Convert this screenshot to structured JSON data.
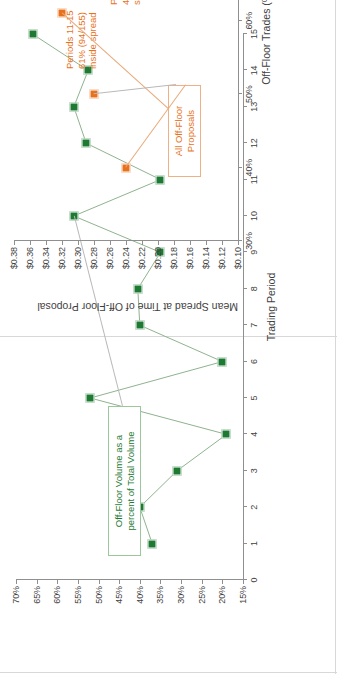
{
  "document": {
    "title": "Off-Floor Trading Charts",
    "orientation": "rotated-90-ccw",
    "background": "#ffffff"
  },
  "colors": {
    "green": "#1E7A32",
    "orange": "#E8721C",
    "navy": "#23337E",
    "axis": "#8F8F8F",
    "text": "#3F3F3F",
    "leader": "#B9B9B9"
  },
  "chart_data": [
    {
      "id": "off-floor-volume-by-period",
      "type": "line",
      "title": "",
      "xlabel": "Trading Period",
      "ylabel": "",
      "grid": false,
      "legend": "none",
      "legend_position": "none",
      "series_color": "#1E7A32",
      "xlim": [
        0,
        15
      ],
      "ylim": [
        15,
        70
      ],
      "xticks": [
        "0",
        "1",
        "2",
        "3",
        "4",
        "5",
        "6",
        "7",
        "8",
        "9",
        "10",
        "11",
        "12",
        "13",
        "14",
        "15"
      ],
      "yticks": [
        "70%",
        "65%",
        "60%",
        "55%",
        "50%",
        "45%",
        "40%",
        "35%",
        "30%",
        "25%",
        "20%",
        "15%"
      ],
      "ytick_values": [
        70,
        65,
        60,
        55,
        50,
        45,
        40,
        35,
        30,
        25,
        20,
        15
      ],
      "x": [
        1,
        2,
        3,
        4,
        5,
        6,
        7,
        8,
        9,
        10,
        11,
        12,
        13,
        14,
        15
      ],
      "values": [
        37,
        40,
        31,
        19,
        52,
        20,
        40,
        40.5,
        35,
        56,
        35,
        53,
        56,
        52.5,
        66
      ],
      "annotations": [
        {
          "text": "Off-Floor Volume as a\npercent of Total Volume",
          "color": "#1E7A32",
          "anchor_x": 10,
          "anchor_y": 56
        }
      ]
    },
    {
      "id": "mean-spread-vs-off-floor-trades",
      "type": "scatter",
      "title": "",
      "xlabel": "Off-Floor Trades (% of total trading volume)",
      "ylabel": "Mean Spread at Time of Off-Floor Proposal",
      "grid": false,
      "legend": "none",
      "legend_position": "none",
      "xlim": [
        30,
        100
      ],
      "ylim": [
        0.1,
        0.38
      ],
      "xticks": [
        "30%",
        "40%",
        "50%",
        "60%",
        "70%",
        "80%",
        "90%",
        "100%"
      ],
      "xtick_values": [
        30,
        40,
        50,
        60,
        70,
        80,
        90,
        100
      ],
      "yticks": [
        "$0.38",
        "$0.36",
        "$0.34",
        "$0.32",
        "$0.30",
        "$0.28",
        "$0.26",
        "$0.24",
        "$0.22",
        "$0.20",
        "$0.18",
        "$0.16",
        "$0.14",
        "$0.12",
        "$0.10"
      ],
      "ytick_values": [
        0.38,
        0.36,
        0.34,
        0.32,
        0.3,
        0.28,
        0.26,
        0.24,
        0.22,
        0.2,
        0.18,
        0.16,
        0.14,
        0.12,
        0.1
      ],
      "series": [
        {
          "name": "All Off-Floor Proposals",
          "color": "#E8721C",
          "group_label": "All Off-Floor\nProposals",
          "points": [
            {
              "label": "Periods 1-5\n40% (62/155)\ninside spread",
              "x": 40,
              "y": 0.24,
              "periods": "1-5",
              "pct": "40%",
              "fraction": "62/155"
            },
            {
              "label": "Periods 6-10\n49% (72/148) inside\nspread",
              "x": 50,
              "y": 0.28,
              "periods": "6-10",
              "pct": "49%",
              "fraction": "72/148"
            },
            {
              "label": "Periods 11-15\n61% (94/155)\ninside spread",
              "x": 61,
              "y": 0.32,
              "periods": "11-15",
              "pct": "61%",
              "fraction": "94/155"
            }
          ]
        },
        {
          "name": "Accepted Off-Floor Proposals",
          "color": "#23337E",
          "group_label": "Accepted\nOff-Floor\nProposals",
          "points": [
            {
              "label": "Periods 1-5\n70% (7/10)\ninside spread",
              "x": 70,
              "y": 0.165,
              "periods": "1-5",
              "pct": "70%",
              "fraction": "7/10"
            },
            {
              "label": "Periods 6-10\n90% (9/10)\ninside spread",
              "x": 91,
              "y": 0.17,
              "periods": "6-10",
              "pct": "90%",
              "fraction": "9/10"
            },
            {
              "label": "Periods 11-15\n93% (14/15)\ninside spread",
              "x": 95,
              "y": 0.325,
              "periods": "11-15",
              "pct": "93%",
              "fraction": "14/15"
            }
          ]
        }
      ]
    }
  ]
}
